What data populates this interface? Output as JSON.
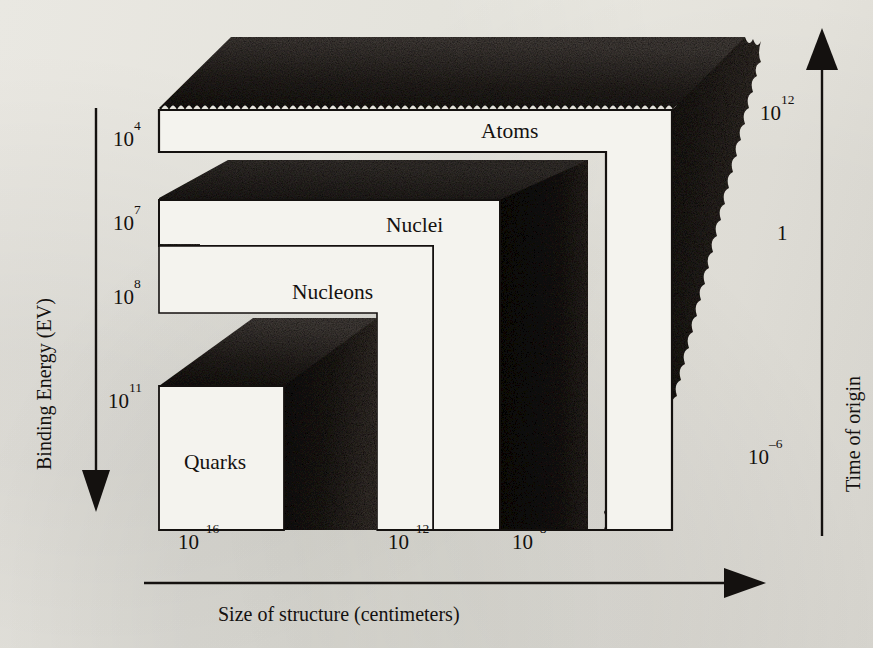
{
  "figure": {
    "type": "schematic-3d-nested-blocks",
    "background_color": "#eceae4",
    "ink_color": "#14110f"
  },
  "axes": {
    "left": {
      "title": "Binding Energy (EV)",
      "direction": "down",
      "arrow": "down-arrow-icon",
      "ticks": [
        {
          "mantissa": "10",
          "exponent": "4",
          "text": "10⁴",
          "y": 138
        },
        {
          "mantissa": "10",
          "exponent": "7",
          "text": "10⁷",
          "y": 222
        },
        {
          "mantissa": "10",
          "exponent": "8",
          "text": "10⁸",
          "y": 296
        },
        {
          "mantissa": "10",
          "exponent": "11",
          "text": "10¹¹",
          "y": 400
        }
      ]
    },
    "bottom": {
      "title": "Size of structure (centimeters)",
      "direction": "right",
      "arrow": "right-arrow-icon",
      "ticks": [
        {
          "mantissa": "10",
          "exponent": "–16",
          "text": "10⁻¹⁶",
          "x": 178
        },
        {
          "mantissa": "10",
          "exponent": "–12",
          "text": "10⁻¹²",
          "x": 388
        },
        {
          "mantissa": "10",
          "exponent": "–8",
          "text": "10⁻⁸",
          "x": 512
        }
      ]
    },
    "right": {
      "title": "Time of origin",
      "direction": "up",
      "arrow": "up-arrow-icon",
      "ticks": [
        {
          "mantissa": "10",
          "exponent": "12",
          "text": "10¹²",
          "y": 112
        },
        {
          "mantissa": "1",
          "exponent": "",
          "text": "1",
          "y": 232
        },
        {
          "mantissa": "10",
          "exponent": "–6",
          "text": "10⁻⁶",
          "y": 456
        }
      ]
    }
  },
  "regions": [
    {
      "id": "atoms",
      "label": "Atoms",
      "x": 481,
      "y": 131
    },
    {
      "id": "nuclei",
      "label": "Nuclei",
      "x": 386,
      "y": 225
    },
    {
      "id": "nucleons",
      "label": "Nucleons",
      "x": 292,
      "y": 292
    },
    {
      "id": "quarks",
      "label": "Quarks",
      "x": 184,
      "y": 463
    }
  ]
}
